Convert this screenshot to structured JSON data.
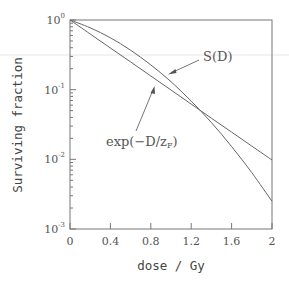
{
  "chart_data": {
    "type": "line",
    "title": "",
    "xlabel": "dose / Gy",
    "ylabel": "Surviving fraction",
    "xlim": [
      0,
      2
    ],
    "ylim": [
      0.001,
      1
    ],
    "yscale": "log",
    "grid": false,
    "legend": "none (inline annotations with arrows)",
    "x_ticks": [
      "0",
      "0.4",
      "0.8",
      "1.2",
      "1.6",
      "2"
    ],
    "x_tick_values": [
      0,
      0.4,
      0.8,
      1.2,
      1.6,
      2
    ],
    "y_ticks": [
      {
        "base": "10",
        "exp": "0",
        "value": 1
      },
      {
        "base": "10",
        "exp": "-1",
        "value": 0.1
      },
      {
        "base": "10",
        "exp": "-2",
        "value": 0.01
      },
      {
        "base": "10",
        "exp": "-3",
        "value": 0.001
      }
    ],
    "x": [
      0,
      0.2,
      0.4,
      0.6,
      0.8,
      1.0,
      1.2,
      1.4,
      1.6,
      1.8,
      2.0
    ],
    "series": [
      {
        "name": "S(D)",
        "label": "S(D)",
        "values": [
          1,
          0.774,
          0.555,
          0.369,
          0.227,
          0.13,
          0.0686,
          0.0337,
          0.0153,
          0.00644,
          0.00251
        ]
      },
      {
        "name": "exp(-D/zF)",
        "label_main": "exp(−D/z",
        "label_sub": "F",
        "label_tail": ")",
        "values": [
          1,
          0.63,
          0.396,
          0.25,
          0.157,
          0.0988,
          0.062,
          0.039,
          0.0246,
          0.0155,
          0.00977
        ]
      }
    ],
    "annotations": [
      {
        "text": "S(D)",
        "points_to_series": "S(D)",
        "at_dose": 1.0
      },
      {
        "text": "exp(−D/zF)",
        "points_to_series": "exp(-D/zF)",
        "at_dose": 0.83
      }
    ],
    "crossing_point": {
      "dose": 1.31,
      "surviving_fraction": 0.047
    }
  }
}
